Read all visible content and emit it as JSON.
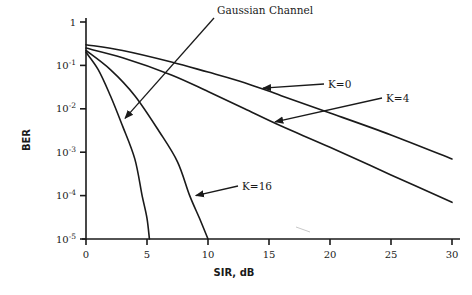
{
  "chart_data": {
    "type": "line",
    "title": "",
    "xlabel": "SIR, dB",
    "ylabel": "BER",
    "xscale": "linear",
    "yscale": "log",
    "xlim": [
      0,
      30
    ],
    "ylim": [
      1e-05,
      1
    ],
    "grid": false,
    "legend": "none (curves labeled by arrow annotations)",
    "x_ticks": [
      0,
      5,
      10,
      15,
      20,
      25,
      30
    ],
    "x_tick_labels": [
      "0",
      "5",
      "10",
      "15",
      "20",
      "25",
      "30"
    ],
    "y_ticks": [
      1,
      0.1,
      0.01,
      0.001,
      0.0001,
      1e-05
    ],
    "y_tick_labels": [
      {
        "base": "1",
        "exp": ""
      },
      {
        "base": "10",
        "exp": "-1"
      },
      {
        "base": "10",
        "exp": "-2"
      },
      {
        "base": "10",
        "exp": "-3"
      },
      {
        "base": "10",
        "exp": "-4"
      },
      {
        "base": "10",
        "exp": "-5"
      }
    ],
    "series": [
      {
        "name": "K=0",
        "x": [
          0,
          3,
          7,
          10,
          13,
          16,
          20,
          25,
          30
        ],
        "values": [
          0.3,
          0.22,
          0.12,
          0.07,
          0.04,
          0.02,
          0.008,
          0.0025,
          0.0007
        ]
      },
      {
        "name": "K=4",
        "x": [
          0,
          3,
          7,
          10,
          13,
          16,
          20,
          25,
          30
        ],
        "values": [
          0.25,
          0.15,
          0.06,
          0.025,
          0.01,
          0.004,
          0.0013,
          0.0003,
          7e-05
        ]
      },
      {
        "name": "K=16",
        "x": [
          0,
          2,
          4,
          6,
          7.5,
          8.5,
          9.3,
          10
        ],
        "values": [
          0.22,
          0.08,
          0.02,
          0.003,
          0.0006,
          0.0001,
          3e-05,
          1e-05
        ]
      },
      {
        "name": "Gaussian Channel",
        "x": [
          0,
          1,
          2,
          3,
          4,
          4.6,
          5,
          5.2
        ],
        "values": [
          0.2,
          0.08,
          0.02,
          0.004,
          0.0007,
          0.0001,
          3e-05,
          1e-05
        ]
      }
    ],
    "annotations": [
      {
        "text": "Gaussian Channel",
        "points_to": "Gaussian Channel",
        "arrow_tip": [
          3.2,
          0.006
        ]
      },
      {
        "text": "K=0",
        "points_to": "K=0",
        "arrow_tip": [
          14.5,
          0.03
        ]
      },
      {
        "text": "K=4",
        "points_to": "K=4",
        "arrow_tip": [
          15.5,
          0.005
        ]
      },
      {
        "text": "K=16",
        "points_to": "K=16",
        "arrow_tip": [
          9,
          0.0001
        ]
      }
    ]
  }
}
